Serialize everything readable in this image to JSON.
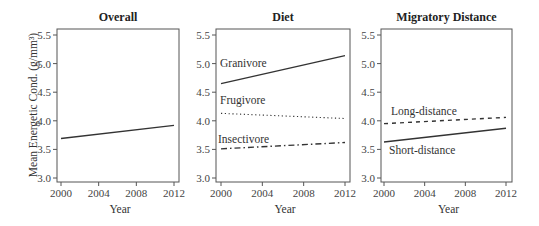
{
  "figure": {
    "ylabel": "Mean Energetic Cond. (g/mm³)",
    "xlabel": "Year",
    "panels": [
      {
        "title": "Overall"
      },
      {
        "title": "Diet"
      },
      {
        "title": "Migratory Distance"
      }
    ]
  },
  "chart_data": [
    {
      "type": "line",
      "title": "Overall",
      "xlabel": "Year",
      "ylabel": "Mean Energetic Cond. (g/mm³)",
      "x": [
        2000,
        2012
      ],
      "xticks": [
        "2000",
        "2004",
        "2008",
        "2012"
      ],
      "yticks": [
        "3.0",
        "3.5",
        "4.0",
        "4.5",
        "5.0",
        "5.5"
      ],
      "ylim": [
        2.95,
        5.6
      ],
      "series": [
        {
          "name": "Overall",
          "style": "solid",
          "values": [
            3.69,
            3.92
          ]
        }
      ]
    },
    {
      "type": "line",
      "title": "Diet",
      "xlabel": "Year",
      "ylabel": "",
      "x": [
        2000,
        2012
      ],
      "xticks": [
        "2000",
        "2004",
        "2008",
        "2012"
      ],
      "yticks": [
        "3.0",
        "3.5",
        "4.0",
        "4.5",
        "5.0",
        "5.5"
      ],
      "ylim": [
        2.95,
        5.6
      ],
      "series": [
        {
          "name": "Granivore",
          "style": "solid",
          "values": [
            4.65,
            5.14
          ]
        },
        {
          "name": "Frugivore",
          "style": "dotted",
          "values": [
            4.13,
            4.04
          ]
        },
        {
          "name": "Insectivore",
          "style": "dashdot",
          "values": [
            3.51,
            3.62
          ]
        }
      ]
    },
    {
      "type": "line",
      "title": "Migratory Distance",
      "xlabel": "Year",
      "ylabel": "",
      "x": [
        2000,
        2012
      ],
      "xticks": [
        "2000",
        "2004",
        "2008",
        "2012"
      ],
      "yticks": [
        "3.0",
        "3.5",
        "4.0",
        "4.5",
        "5.0",
        "5.5"
      ],
      "ylim": [
        2.95,
        5.6
      ],
      "series": [
        {
          "name": "Long-distance",
          "style": "dashed",
          "values": [
            3.95,
            4.06
          ]
        },
        {
          "name": "Short-distance",
          "style": "solid",
          "values": [
            3.63,
            3.87
          ]
        }
      ]
    }
  ]
}
